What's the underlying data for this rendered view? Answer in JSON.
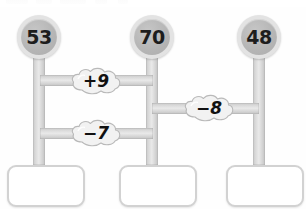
{
  "worksheet": {
    "title": "number-chain-worksheet",
    "colors": {
      "node_fill": "#b6b6b6",
      "node_ring": "#e3e3e3",
      "pipe": "#d9d9d9",
      "box_border": "#d2d2d2",
      "text": "#1d1d1d",
      "background": "#ffffff"
    },
    "nodes": [
      {
        "id": "node-left",
        "value": "53"
      },
      {
        "id": "node-middle",
        "value": "70"
      },
      {
        "id": "node-right",
        "value": "48"
      }
    ],
    "operations": [
      {
        "id": "op-plus-9",
        "label": "+9",
        "sign": "+",
        "operand": "9",
        "between": [
          "53",
          "70"
        ]
      },
      {
        "id": "op-minus-7",
        "label": "−7",
        "sign": "−",
        "operand": "7",
        "between": [
          "53",
          "70"
        ]
      },
      {
        "id": "op-minus-8",
        "label": "−8",
        "sign": "−",
        "operand": "8",
        "between": [
          "70",
          "48"
        ]
      }
    ],
    "answers": [
      {
        "id": "answer-left",
        "value": "",
        "placeholder": ""
      },
      {
        "id": "answer-middle",
        "value": "",
        "placeholder": ""
      },
      {
        "id": "answer-right",
        "value": "",
        "placeholder": ""
      }
    ]
  }
}
